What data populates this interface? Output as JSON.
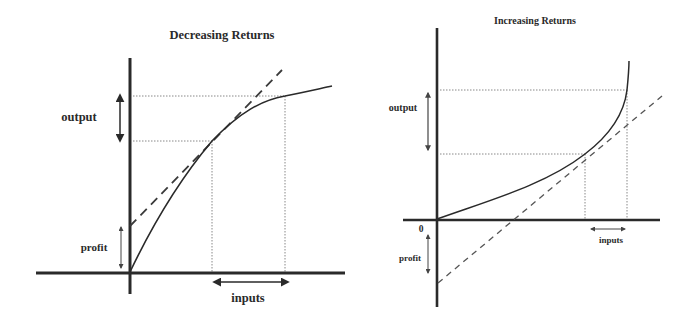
{
  "diagrams": [
    {
      "title": "Decreasing Returns",
      "labels": {
        "output": "output",
        "profit": "profit",
        "inputs": "inputs"
      },
      "geometry": {
        "axes": {
          "y_axis": [
            130,
            58,
            130,
            294
          ],
          "x_axis": [
            36,
            273,
            345,
            273
          ]
        },
        "curve": "M130,272 C150,230 175,185 212,141 C240,112 262,100 285,96 C300,93 318,89 332,86",
        "tangent": [
          130,
          226,
          282,
          70
        ],
        "dotted_h": [
          [
            133,
            96,
            285,
            96
          ],
          [
            133,
            141,
            212,
            141
          ]
        ],
        "dotted_v": [
          [
            212,
            141,
            212,
            272
          ],
          [
            285,
            96,
            285,
            272
          ]
        ],
        "output_arrow": [
          120,
          93,
          120,
          143
        ],
        "profit_arrow": [
          121,
          225,
          121,
          270
        ],
        "inputs_arrow": [
          212,
          282,
          290,
          282
        ]
      }
    },
    {
      "title": "Increasing Returns",
      "labels": {
        "output": "output",
        "profit": "profit",
        "inputs": "inputs",
        "origin": "0"
      },
      "geometry": {
        "axes": {
          "y_axis": [
            437,
            28,
            437,
            307
          ],
          "x_axis": [
            403,
            220,
            660,
            220
          ]
        },
        "curve": "M437,219 C490,200 545,185 585,154 C610,135 624,115 627,90 C628,80 629,70 629,61",
        "tangent": [
          438,
          283,
          662,
          96
        ],
        "dotted_h": [
          [
            440,
            90,
            627,
            90
          ],
          [
            440,
            154,
            585,
            154
          ]
        ],
        "dotted_v": [
          [
            585,
            154,
            585,
            219
          ],
          [
            627,
            90,
            627,
            219
          ]
        ],
        "output_arrow": [
          428,
          91,
          428,
          152
        ],
        "profit_arrow": [
          428,
          233,
          428,
          275
        ],
        "inputs_arrow": [
          589,
          229,
          627,
          229
        ]
      }
    }
  ],
  "colors": {
    "ink": "#2a2a2a",
    "dotted": "#888888",
    "background": "#ffffff"
  }
}
